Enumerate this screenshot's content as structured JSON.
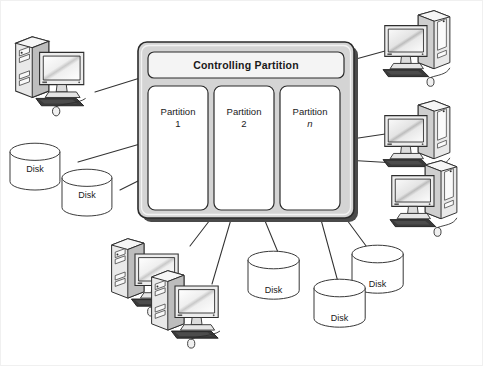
{
  "diagram": {
    "host_box": {
      "name": "partitioned-host",
      "fill": "#d4d4d4",
      "border": "#2b2b2b"
    },
    "controlling_partition": {
      "label": "Controlling Partition",
      "fill": "#f2f2f2"
    },
    "partitions": [
      {
        "label": "Partition",
        "number": "1",
        "italic": false
      },
      {
        "label": "Partition",
        "number": "2",
        "italic": false
      },
      {
        "label": "Partition",
        "number": "n",
        "italic": true
      }
    ],
    "disks": [
      {
        "label": "Disk",
        "position": "upper-left-back"
      },
      {
        "label": "Disk",
        "position": "upper-left-front"
      },
      {
        "label": "Disk",
        "position": "bottom-center"
      },
      {
        "label": "Disk",
        "position": "bottom-right-back"
      },
      {
        "label": "Disk",
        "position": "bottom-right-front"
      }
    ],
    "computers": [
      {
        "name": "computer-left",
        "orientation": "tower-left"
      },
      {
        "name": "computer-right-top",
        "orientation": "tower-right"
      },
      {
        "name": "computer-right-middle",
        "orientation": "tower-right"
      },
      {
        "name": "computer-right-bottom",
        "orientation": "tower-right"
      },
      {
        "name": "computer-bottom-back",
        "orientation": "tower-left"
      },
      {
        "name": "computer-bottom-front",
        "orientation": "tower-left"
      }
    ],
    "connector_count": 11,
    "colors": {
      "line": "#333333",
      "panel_fill": "#ffffff",
      "host_fill": "#d4d4d4",
      "screen_light": "#ffffff",
      "screen_dark": "#9a9a9a",
      "case_fill": "#e8e8e8",
      "case_shadow": "#8f8f8f",
      "keyboard": "#3a3a3a"
    }
  }
}
